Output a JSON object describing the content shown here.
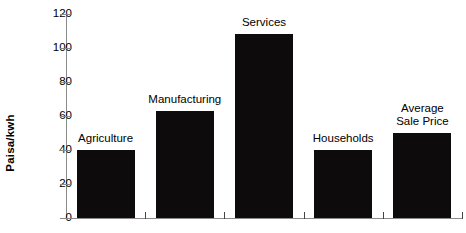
{
  "chart_data": {
    "type": "bar",
    "title": "",
    "xlabel": "",
    "ylabel": "Paisa/kwh",
    "ylim": [
      0,
      120
    ],
    "grid": false,
    "legend": "none",
    "bar_color": "#0d0b0b",
    "axis_color": "#8a8a8a",
    "categories": [
      "Agriculture",
      "Manufacturing",
      "Services",
      "Households",
      "Average\nSale Price"
    ],
    "values": [
      40,
      63,
      108,
      40,
      50
    ],
    "yticks": [
      0,
      20,
      40,
      60,
      80,
      100,
      120
    ],
    "ytick_labels": [
      "0",
      "20",
      "40",
      "60",
      "80",
      "100",
      "120"
    ]
  },
  "axis": {
    "y_title": "Paisa/kwh"
  },
  "bars": [
    {
      "label": "Agriculture",
      "value": 40,
      "label_lines": [
        "Agriculture"
      ]
    },
    {
      "label": "Manufacturing",
      "value": 63,
      "label_lines": [
        "Manufacturing"
      ]
    },
    {
      "label": "Services",
      "value": 108,
      "label_lines": [
        "Services"
      ]
    },
    {
      "label": "Households",
      "value": 40,
      "label_lines": [
        "Households"
      ]
    },
    {
      "label": "Average Sale Price",
      "value": 50,
      "label_lines": [
        "Average",
        "Sale Price"
      ]
    }
  ]
}
